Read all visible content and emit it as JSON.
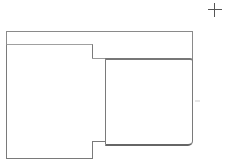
{
  "diagram": {
    "shapes": [
      {
        "id": "outer-frame",
        "type": "rectangle-open-bottom"
      },
      {
        "id": "left-panel",
        "type": "rectangle"
      },
      {
        "id": "connector",
        "type": "rectangle"
      },
      {
        "id": "right-card",
        "type": "rounded-rectangle"
      }
    ],
    "icons": {
      "crosshair": "crosshair-icon"
    },
    "colors": {
      "stroke": "#7a7a7a",
      "background": "#ffffff"
    }
  }
}
